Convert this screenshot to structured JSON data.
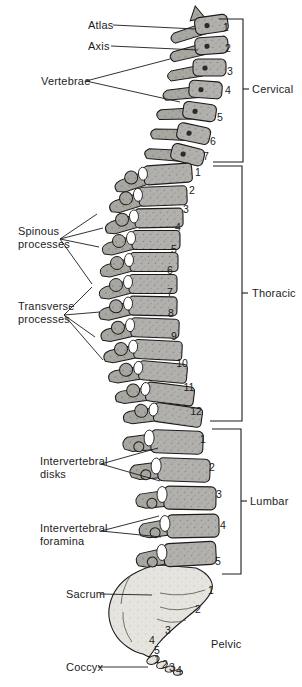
{
  "figure": {
    "labels": {
      "atlas": "Atlas",
      "axis": "Axis",
      "vertebrae": "Vertebrae",
      "spinous_processes": "Spinous\nprocesses",
      "transverse_processes": "Transverse\nprocesses",
      "intervertebral_disks": "Intervertebral\ndisks",
      "intervertebral_foramina": "Intervertebral\nforamina",
      "sacrum": "Sacrum",
      "coccyx": "Coccyx",
      "cervical": "Cervical",
      "thoracic": "Thoracic",
      "lumbar": "Lumbar",
      "pelvic": "Pelvic"
    },
    "numbering": {
      "cervical": [
        "1",
        "2",
        "3",
        "4",
        "5",
        "6",
        "7"
      ],
      "thoracic": [
        "1",
        "2",
        "3",
        "4",
        "5",
        "6",
        "7",
        "8",
        "9",
        "10",
        "11",
        "12"
      ],
      "lumbar": [
        "1",
        "2",
        "3",
        "4",
        "5"
      ],
      "sacral": [
        "1",
        "2",
        "3",
        "4",
        "5"
      ],
      "coccygeal": [
        "1",
        "2",
        "3",
        "4"
      ]
    },
    "colors": {
      "bone": "#b3b1ad",
      "process_bone": "#a9a7a2",
      "sacrum_bone": "#e6e4de",
      "ink": "#1c1c1c",
      "background": "#ffffff"
    }
  }
}
